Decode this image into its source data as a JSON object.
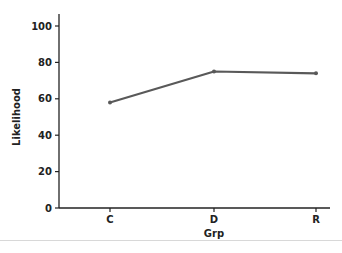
{
  "chart_data": {
    "type": "line",
    "title": "",
    "xlabel": "Grp",
    "ylabel": "Likelihood",
    "categories": [
      "C",
      "D",
      "R"
    ],
    "series": [
      {
        "name": "Likelihood",
        "values": [
          58,
          75,
          74
        ],
        "color": "#595959"
      }
    ],
    "ylim": [
      0,
      100
    ],
    "yticks": [
      0,
      20,
      40,
      60,
      80,
      100
    ],
    "grid": false,
    "legend": "none"
  }
}
